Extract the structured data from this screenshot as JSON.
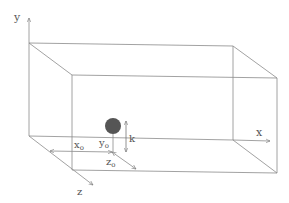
{
  "diagram": {
    "type": "3d-box-coordinate-diagram",
    "axes": {
      "x": {
        "label": "x"
      },
      "y": {
        "label": "y"
      },
      "z": {
        "label": "z"
      }
    },
    "object": {
      "name": "sphere",
      "color": "#555555"
    },
    "annotations": {
      "x0": {
        "base": "x",
        "sub": "o"
      },
      "y0": {
        "base": "y",
        "sub": "o"
      },
      "z0": {
        "base": "z",
        "sub": "o"
      },
      "k": "k"
    },
    "colors": {
      "line": "#8a8a8a",
      "text": "#555555",
      "sphere": "#555555"
    }
  }
}
